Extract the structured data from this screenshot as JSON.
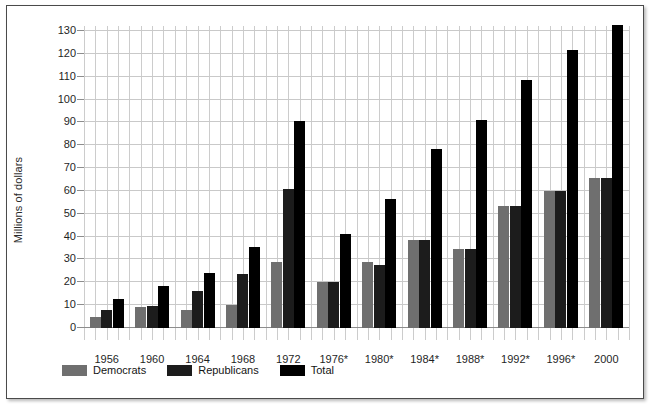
{
  "chart_data": {
    "type": "bar",
    "title": "",
    "xlabel": "",
    "ylabel": "Millions of dollars",
    "ylim": [
      0,
      130
    ],
    "ytick_step": 10,
    "yticks": [
      0,
      10,
      20,
      30,
      40,
      50,
      60,
      70,
      80,
      90,
      100,
      110,
      120,
      130
    ],
    "grid": true,
    "legend_position": "bottom-left",
    "categories": [
      "1956",
      "1960",
      "1964",
      "1968",
      "1972",
      "1976*",
      "1980*",
      "1984*",
      "1988*",
      "1992*",
      "1996*",
      "2000"
    ],
    "series": [
      {
        "name": "Democrats",
        "color": "#6f6f6f",
        "values": [
          5,
          9,
          8,
          10,
          29,
          20,
          29,
          38.5,
          34.5,
          53.5,
          60,
          65.5
        ]
      },
      {
        "name": "Republicans",
        "color": "#1c1c1c",
        "values": [
          8,
          9.5,
          16,
          23.5,
          61,
          20,
          27.5,
          38.5,
          34.5,
          53.5,
          60,
          65.5
        ]
      },
      {
        "name": "Total",
        "color": "#000000",
        "values": [
          12.5,
          18.5,
          24,
          35.5,
          90.5,
          41,
          56.5,
          78.5,
          91,
          108.5,
          121.5,
          132.5
        ]
      }
    ]
  },
  "legend": {
    "items": [
      {
        "label": "Democrats",
        "swatch": "dem"
      },
      {
        "label": "Republicans",
        "swatch": "rep"
      },
      {
        "label": "Total",
        "swatch": "total"
      }
    ]
  },
  "axis": {
    "y_title": "Millions of dollars"
  }
}
